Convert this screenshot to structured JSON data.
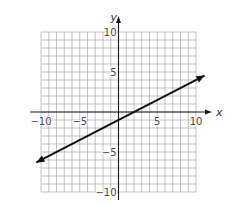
{
  "chart_data": {
    "type": "line",
    "title": "",
    "xlabel": "x",
    "ylabel": "y",
    "xlim": [
      -10,
      10
    ],
    "ylim": [
      -10,
      10
    ],
    "grid": true,
    "grid_step": 1,
    "x_ticks": [
      "-10",
      "-5",
      "5",
      "10"
    ],
    "y_ticks": [
      "10",
      "5",
      "-5",
      "-10"
    ],
    "series": [
      {
        "name": "line",
        "equation": "y = 0.5x - 1",
        "slope": 0.5,
        "intercept": -1,
        "x": [
          -10.6,
          11.1
        ],
        "y": [
          -6.3,
          4.55
        ],
        "arrows": "both"
      }
    ],
    "colors": {
      "grid": "#9a9a9a",
      "axis": "#1a1a1a",
      "line": "#111111"
    }
  }
}
